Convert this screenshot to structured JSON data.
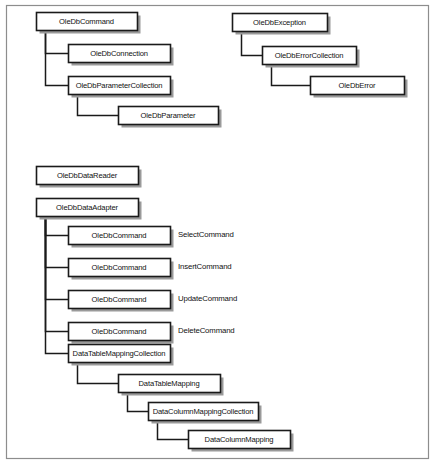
{
  "figure": {
    "frame": {
      "x": 6,
      "y": 5,
      "width": 422,
      "height": 453,
      "color": "#8d8d8d"
    },
    "colors": {
      "box_fill": "#ffffff",
      "box_stroke": "#1a1a1a",
      "shadow": "#9a9a9a",
      "connector": "#1a1a1a",
      "text": "#111111"
    }
  },
  "clusters": [
    {
      "name": "oledb-command-cluster",
      "root": "OleDbCommand",
      "nodes": [
        {
          "id": "n1",
          "label": "OleDbCommand",
          "x": 36,
          "y": 12,
          "w": 101,
          "h": 18
        },
        {
          "id": "n2",
          "label": "OleDbConnection",
          "x": 68,
          "y": 44,
          "w": 102,
          "h": 18
        },
        {
          "id": "n3",
          "label": "OleDbParameterCollection",
          "x": 68,
          "y": 76,
          "w": 102,
          "h": 18
        },
        {
          "id": "n4",
          "label": "OleDbParameter",
          "x": 118,
          "y": 106,
          "w": 100,
          "h": 18
        }
      ],
      "edges": [
        {
          "from": "n1",
          "to": "n2"
        },
        {
          "from": "n1",
          "to": "n3"
        },
        {
          "from": "n3",
          "to": "n4"
        }
      ]
    },
    {
      "name": "oledb-exception-cluster",
      "root": "OleDbException",
      "nodes": [
        {
          "id": "e1",
          "label": "OleDbException",
          "x": 232,
          "y": 13,
          "w": 95,
          "h": 18
        },
        {
          "id": "e2",
          "label": "OleDbErrorCollection",
          "x": 262,
          "y": 46,
          "w": 94,
          "h": 18
        },
        {
          "id": "e3",
          "label": "OleDbError",
          "x": 310,
          "y": 76,
          "w": 94,
          "h": 18
        }
      ],
      "edges": [
        {
          "from": "e1",
          "to": "e2"
        },
        {
          "from": "e2",
          "to": "e3"
        }
      ]
    },
    {
      "name": "oledb-datareader-cluster",
      "root": "OleDbDataReader",
      "nodes": [
        {
          "id": "r1",
          "label": "OleDbDataReader",
          "x": 36,
          "y": 166,
          "w": 102,
          "h": 18
        }
      ],
      "edges": []
    },
    {
      "name": "oledb-dataadapter-cluster",
      "root": "OleDbDataAdapter",
      "nodes": [
        {
          "id": "a1",
          "label": "OleDbDataAdapter",
          "x": 36,
          "y": 198,
          "w": 102,
          "h": 18
        },
        {
          "id": "a2",
          "label": "OleDbCommand",
          "x": 68,
          "y": 226,
          "w": 102,
          "h": 18
        },
        {
          "id": "a3",
          "label": "OleDbCommand",
          "x": 68,
          "y": 258,
          "w": 102,
          "h": 18
        },
        {
          "id": "a4",
          "label": "OleDbCommand",
          "x": 68,
          "y": 290,
          "w": 102,
          "h": 18
        },
        {
          "id": "a5",
          "label": "OleDbCommand",
          "x": 68,
          "y": 322,
          "w": 102,
          "h": 18
        },
        {
          "id": "a6",
          "label": "DataTableMappingCollection",
          "x": 68,
          "y": 344,
          "w": 102,
          "h": 18
        },
        {
          "id": "a7",
          "label": "DataTableMapping",
          "x": 118,
          "y": 374,
          "w": 102,
          "h": 18
        },
        {
          "id": "a8",
          "label": "DataColumnMappingCollection",
          "x": 148,
          "y": 402,
          "w": 110,
          "h": 18
        },
        {
          "id": "a9",
          "label": "DataColumnMapping",
          "x": 188,
          "y": 430,
          "w": 102,
          "h": 18
        }
      ],
      "edges": [
        {
          "from": "a1",
          "to": "a2"
        },
        {
          "from": "a1",
          "to": "a3"
        },
        {
          "from": "a1",
          "to": "a4"
        },
        {
          "from": "a1",
          "to": "a5"
        },
        {
          "from": "a1",
          "to": "a6"
        },
        {
          "from": "a6",
          "to": "a7"
        },
        {
          "from": "a7",
          "to": "a8"
        },
        {
          "from": "a8",
          "to": "a9"
        }
      ]
    }
  ],
  "side_labels": [
    {
      "id": "s1",
      "text": "SelectCommand",
      "x": 178,
      "y": 235
    },
    {
      "id": "s2",
      "text": "InsertCommand",
      "x": 178,
      "y": 267
    },
    {
      "id": "s3",
      "text": "UpdateCommand",
      "x": 178,
      "y": 299
    },
    {
      "id": "s4",
      "text": "DeleteCommand",
      "x": 178,
      "y": 331
    }
  ]
}
